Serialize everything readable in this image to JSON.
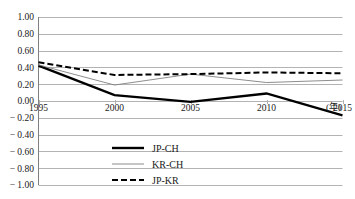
{
  "chart_data": {
    "type": "line",
    "title": "",
    "subtitle": "",
    "xlabel": "(年)",
    "ylabel": "",
    "x": [
      1995,
      2000,
      2005,
      2010,
      2015
    ],
    "categories": [
      "1995",
      "2000",
      "2005",
      "2010",
      "2015"
    ],
    "xlim": [
      1995,
      2015
    ],
    "ylim": [
      -1.0,
      1.0
    ],
    "ytick_labels": [
      "1.00",
      "0.80",
      "0.60",
      "0.40",
      "0.20",
      "0.00",
      "− 0.20",
      "− 0.40",
      "− 0.60",
      "− 0.80",
      "− 1.00"
    ],
    "ytick_values": [
      1.0,
      0.8,
      0.6,
      0.4,
      0.2,
      0.0,
      -0.2,
      -0.4,
      -0.6,
      -0.8,
      -1.0
    ],
    "grid": true,
    "grid_axis": "y",
    "grid_color": "#b3b3b3",
    "legend_position": "inside-bottom-center",
    "series": [
      {
        "name": "JP-CH",
        "values": [
          0.42,
          0.07,
          -0.01,
          0.09,
          -0.17
        ],
        "color": "#000000",
        "style": "solid",
        "width": 2.4
      },
      {
        "name": "KR-CH",
        "values": [
          0.43,
          0.19,
          0.32,
          0.22,
          0.25
        ],
        "color": "#808080",
        "style": "solid",
        "width": 0.9
      },
      {
        "name": "JP-KR",
        "values": [
          0.46,
          0.31,
          0.32,
          0.34,
          0.33
        ],
        "color": "#000000",
        "style": "dashed",
        "width": 2.0
      }
    ]
  },
  "axes": {
    "x_unit_label": "(年)"
  },
  "legend": {
    "entries": [
      {
        "label": "JP-CH"
      },
      {
        "label": "KR-CH"
      },
      {
        "label": "JP-KR"
      }
    ]
  }
}
